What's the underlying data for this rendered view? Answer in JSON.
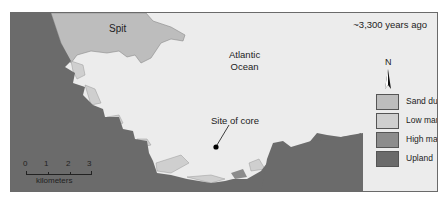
{
  "map": {
    "title_time": "~3,300 years ago",
    "labels": {
      "spit": "Spit",
      "ocean_line1": "Atlantic",
      "ocean_line2": "Ocean",
      "core_site": "Site of core"
    },
    "north_arrow": {
      "label": "N",
      "icon": "north-arrow-icon"
    },
    "legend": [
      {
        "label": "Sand dunes",
        "color": "#bdbdbd"
      },
      {
        "label": "Low marsh",
        "color": "#cfcfcf"
      },
      {
        "label": "High marsh",
        "color": "#8c8c8c"
      },
      {
        "label": "Upland",
        "color": "#6b6b6b"
      }
    ],
    "scale_bar": {
      "ticks": [
        "0",
        "1",
        "2",
        "3"
      ],
      "unit": "kilometers"
    },
    "colors": {
      "ocean": "#ececec",
      "upland": "#6b6b6b",
      "sand_dunes": "#bdbdbd",
      "low_marsh": "#cfcfcf",
      "high_marsh": "#8c8c8c",
      "core_marker": "#000000"
    }
  }
}
